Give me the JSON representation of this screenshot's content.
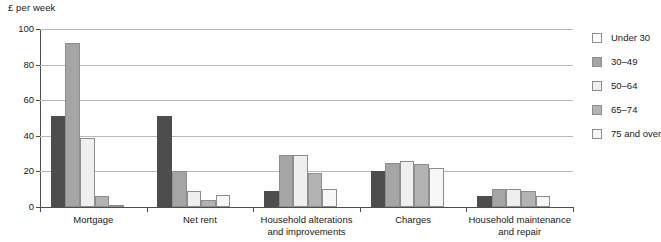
{
  "chart_data": {
    "type": "bar",
    "title": "",
    "ylabel": "£ per week",
    "xlabel": "",
    "ylim": [
      0,
      100
    ],
    "yticks": [
      0,
      20,
      40,
      60,
      80,
      100
    ],
    "grid": true,
    "legend_position": "right",
    "categories": [
      "Mortgage",
      "Net rent",
      "Household alterations\nand improvements",
      "Charges",
      "Household maintenance\nand repair"
    ],
    "series": [
      {
        "name": "Under 30",
        "color": "#4d4d4d",
        "values": [
          51,
          51,
          9,
          20,
          6
        ]
      },
      {
        "name": "30–49",
        "color": "#a5a5a5",
        "values": [
          92,
          20,
          29,
          25,
          10
        ]
      },
      {
        "name": "50–64",
        "color": "#efefef",
        "values": [
          39,
          9,
          29,
          26,
          10
        ]
      },
      {
        "name": "65–74",
        "color": "#b3b3b3",
        "values": [
          6,
          4,
          19,
          24,
          9
        ]
      },
      {
        "name": "75 and over",
        "color": "#f7f7f7",
        "values": [
          1,
          7,
          10,
          22,
          6
        ]
      }
    ]
  },
  "legend": {
    "items": [
      {
        "label": "Under 30",
        "swatch": "#ffffff"
      },
      {
        "label": "30–49",
        "swatch": "#a5a5a5"
      },
      {
        "label": "50–64",
        "swatch": "#efefef"
      },
      {
        "label": "65–74",
        "swatch": "#b3b3b3"
      },
      {
        "label": "75 and over",
        "swatch": "#f7f7f7"
      }
    ]
  }
}
